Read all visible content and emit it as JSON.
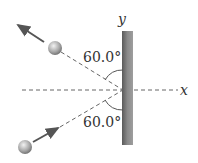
{
  "diagram": {
    "axes": {
      "x_label": "x",
      "y_label": "y"
    },
    "angles": {
      "upper": "60.0°",
      "lower": "60.0°"
    },
    "elements": [
      "wall",
      "incoming-ball",
      "outgoing-ball",
      "dashed-trajectories"
    ],
    "colors": {
      "wall": "#6e6e6e",
      "ball": "#9a9a9a",
      "line": "#555555"
    }
  }
}
